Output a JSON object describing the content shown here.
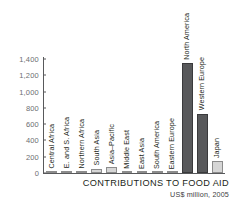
{
  "chart_data": {
    "type": "bar",
    "title": "CONTRIBUTIONS TO FOOD AID",
    "subtitle": "US$ million, 2005",
    "xlabel": "",
    "ylabel": "",
    "ylim": [
      0,
      1400
    ],
    "grid": false,
    "legend": "none",
    "ytick_labels": [
      "1,400",
      "1,200",
      "1,000",
      "800",
      "600",
      "400",
      "200",
      "0"
    ],
    "ytick_values": [
      1400,
      1200,
      1000,
      800,
      600,
      400,
      200,
      0
    ],
    "categories": [
      "Central Africa",
      "E. and S. Africa",
      "Northern Africa",
      "South Asia",
      "Asia–Pacific",
      "Middle East",
      "East Asia",
      "South America",
      "Eastern Europe",
      "North America",
      "Western Europe",
      "Japan"
    ],
    "values": [
      10,
      25,
      15,
      55,
      75,
      18,
      8,
      6,
      5,
      1350,
      730,
      150
    ],
    "bar_styles": [
      "light",
      "light",
      "light",
      "light",
      "light",
      "light",
      "light",
      "light",
      "light",
      "dark",
      "dark",
      "light"
    ],
    "colors": {
      "bar_dark": "#58595b",
      "bar_light": "#d6d6d6",
      "axis": "#58595b",
      "tick_text": "#6d6e71",
      "label_text": "#231f20",
      "background": "#ffffff"
    }
  }
}
